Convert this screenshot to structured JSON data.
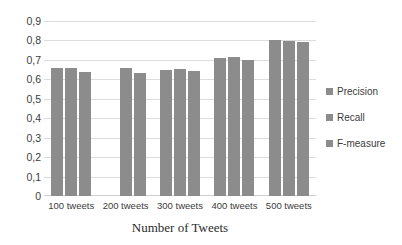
{
  "chart_data": {
    "type": "bar",
    "title": "",
    "subtitle": "",
    "xlabel": "Number of Tweets",
    "ylabel": "",
    "categories": [
      "100 tweets",
      "200 tweets",
      "300 tweets",
      "400 tweets",
      "500 tweets"
    ],
    "series": [
      {
        "name": "Precision",
        "values": [
          0.66,
          null,
          0.65,
          0.71,
          0.8
        ]
      },
      {
        "name": "Recall",
        "values": [
          0.66,
          0.66,
          0.655,
          0.715,
          0.795
        ]
      },
      {
        "name": "F-measure",
        "values": [
          0.64,
          0.635,
          0.645,
          0.7,
          0.79
        ]
      }
    ],
    "ylim": [
      0,
      0.9
    ],
    "ytick_values": [
      0,
      0.1,
      0.2,
      0.3,
      0.4,
      0.5,
      0.6,
      0.7,
      0.8,
      0.9
    ],
    "ytick_labels": [
      "0",
      "0,1",
      "0,2",
      "0,3",
      "0,4",
      "0,5",
      "0,6",
      "0,7",
      "0,8",
      "0,9"
    ],
    "decimal_separator": ",",
    "grid": true,
    "grid_axis": "y",
    "legend_position": "right",
    "legend_entries": [
      "Precision",
      "Recall",
      "F-measure"
    ],
    "bar_color": "#8c8c8c",
    "grid_color": "#dcdcdc",
    "background_color": "#ffffff",
    "text_color": "#3c3c3c"
  }
}
